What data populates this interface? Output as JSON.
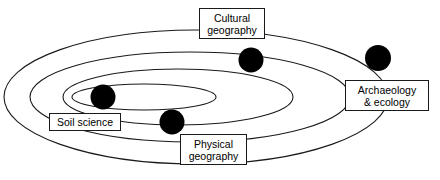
{
  "diagram": {
    "background_color": "#ffffff",
    "stroke_color": "#1a1a1a",
    "node_fill_color": "#000000",
    "rings": [
      {
        "name": "outer-ring",
        "cx": 196,
        "cy": 97,
        "rx": 192,
        "ry": 67
      },
      {
        "name": "second-ring",
        "cx": 190,
        "cy": 97,
        "rx": 160,
        "ry": 45
      },
      {
        "name": "third-ring",
        "cx": 178,
        "cy": 97,
        "rx": 115,
        "ry": 28
      },
      {
        "name": "inner-ring",
        "cx": 144,
        "cy": 97,
        "rx": 72,
        "ry": 13
      }
    ],
    "nodes": [
      {
        "name": "cultural-geography-node",
        "cx": 251,
        "cy": 60,
        "r": 12.5
      },
      {
        "name": "archaeology-ecology-node",
        "cx": 378,
        "cy": 58,
        "r": 13
      },
      {
        "name": "soil-science-node",
        "cx": 103,
        "cy": 97,
        "r": 12.5
      },
      {
        "name": "physical-geography-node",
        "cx": 172,
        "cy": 122,
        "r": 12.5
      }
    ],
    "labels": [
      {
        "name": "cultural-geography",
        "line1": "Cultural",
        "line2": "geography",
        "x": 199,
        "y": 8,
        "w": 66,
        "h": 31
      },
      {
        "name": "archaeology-ecology",
        "line1": "Archaeology",
        "line2": "& ecology",
        "x": 345,
        "y": 80,
        "w": 84,
        "h": 31
      },
      {
        "name": "soil-science",
        "line1": "Soil science",
        "line2": "",
        "x": 49,
        "y": 113,
        "w": 72,
        "h": 18
      },
      {
        "name": "physical-geography",
        "line1": "Physical",
        "line2": "geography",
        "x": 180,
        "y": 134,
        "w": 67,
        "h": 31
      }
    ]
  }
}
